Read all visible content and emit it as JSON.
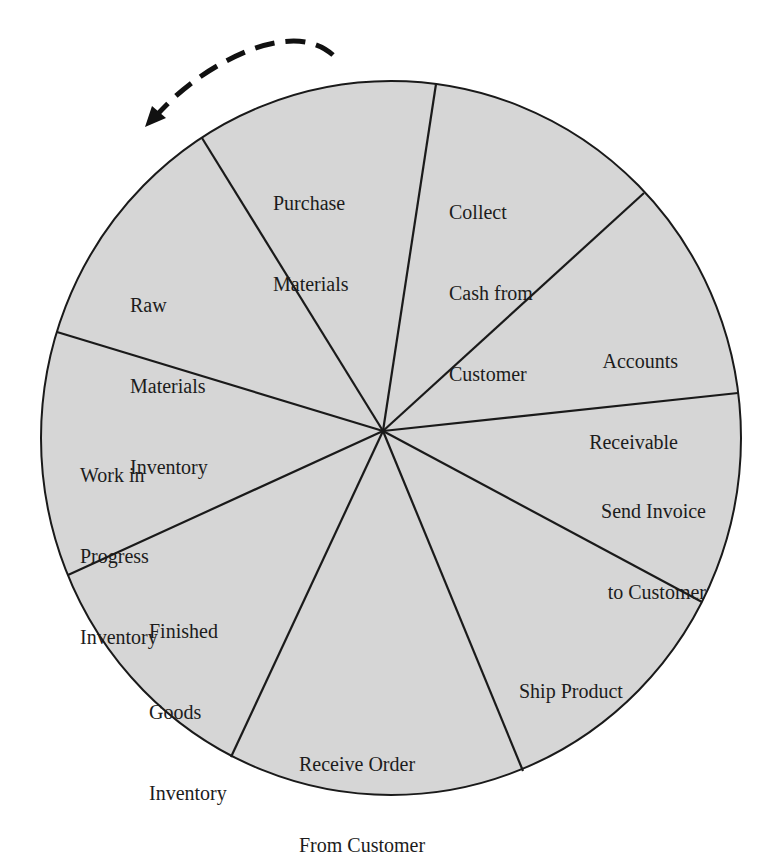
{
  "diagram": {
    "type": "cycle-wheel",
    "fill_color": "#d6d6d6",
    "line_color": "#1a1a1a",
    "direction_arrow": "counterclockwise",
    "segments": [
      {
        "id": "purchase-materials",
        "lines": [
          "Purchase",
          "Materials"
        ]
      },
      {
        "id": "raw-materials-inventory",
        "lines": [
          "Raw",
          "Materials",
          "Inventory"
        ]
      },
      {
        "id": "work-in-progress-inventory",
        "lines": [
          "Work in",
          "Progress",
          "Inventory"
        ]
      },
      {
        "id": "finished-goods-inventory",
        "lines": [
          "Finished",
          "Goods",
          "Inventory"
        ]
      },
      {
        "id": "receive-order",
        "lines": [
          "Receive Order",
          "From Customer"
        ]
      },
      {
        "id": "ship-product",
        "lines": [
          "Ship Product"
        ]
      },
      {
        "id": "send-invoice",
        "lines": [
          "Send Invoice",
          "to Customer"
        ]
      },
      {
        "id": "accounts-receivable",
        "lines": [
          "Accounts",
          "Receivable"
        ]
      },
      {
        "id": "collect-cash",
        "lines": [
          "Collect",
          "Cash from",
          "Customer"
        ]
      }
    ]
  }
}
